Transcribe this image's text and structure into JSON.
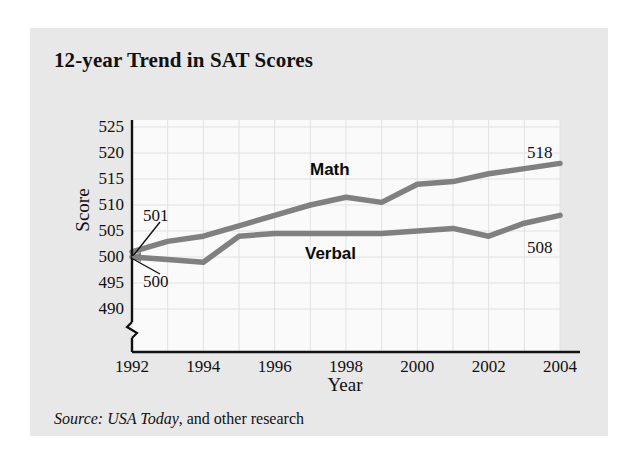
{
  "title": "12-year Trend in SAT Scores",
  "source": {
    "italic_part": "Source: USA Today",
    "roman_part": ", and other research"
  },
  "colors": {
    "panel_background": "#e8e8e8",
    "plot_background": "#fafafa",
    "line": "#808080",
    "axis": "#111111",
    "grid": "#e4e4e4",
    "text": "#111111"
  },
  "annotations": {
    "math_series_label": "Math",
    "verbal_series_label": "Verbal",
    "math_start_value": "501",
    "verbal_start_value": "500",
    "math_end_value": "518",
    "verbal_end_value": "508"
  },
  "chart_data": {
    "type": "line",
    "title": "12-year Trend in SAT Scores",
    "xlabel": "Year",
    "ylabel": "Score",
    "xlim": [
      1992,
      2004
    ],
    "ylim": [
      490,
      525
    ],
    "ytick_labels": [
      "490",
      "495",
      "500",
      "505",
      "510",
      "515",
      "520",
      "525"
    ],
    "yticks": [
      490,
      495,
      500,
      505,
      510,
      515,
      520,
      525
    ],
    "xtick_labels": [
      "1992",
      "1994",
      "1996",
      "1998",
      "2000",
      "2002",
      "2004"
    ],
    "xticks": [
      1992,
      1994,
      1996,
      1998,
      2000,
      2002,
      2004
    ],
    "x": [
      1992,
      1993,
      1994,
      1995,
      1996,
      1997,
      1998,
      1999,
      2000,
      2001,
      2002,
      2003,
      2004
    ],
    "grid": true,
    "axis_break": true,
    "legend_position": "inline-labels",
    "series": [
      {
        "name": "Math",
        "color": "#808080",
        "values": [
          501,
          503,
          504,
          506,
          508,
          510,
          511.5,
          510.5,
          514,
          514.5,
          516,
          517,
          518
        ]
      },
      {
        "name": "Verbal",
        "color": "#808080",
        "values": [
          500,
          499.5,
          499,
          504,
          504.5,
          504.5,
          504.5,
          504.5,
          505,
          505.5,
          504,
          506.5,
          508
        ]
      }
    ]
  }
}
